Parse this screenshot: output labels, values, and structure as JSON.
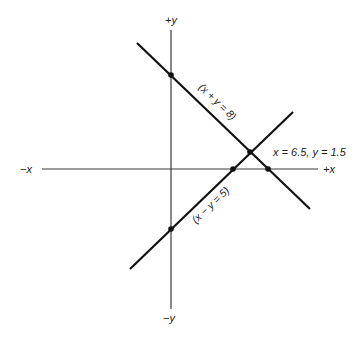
{
  "diagram": {
    "type": "coordinate-plane-linear-equations",
    "axes": {
      "pos_y_label": "+y",
      "neg_y_label": "−y",
      "pos_x_label": "+x",
      "neg_x_label": "−x"
    },
    "lines": [
      {
        "name": "sum-line",
        "equation_label": "(x + y = 8)",
        "slope_direction": "descending"
      },
      {
        "name": "difference-line",
        "equation_label": "(x − y = 5)",
        "slope_direction": "ascending"
      }
    ],
    "solution_label": "x = 6.5, y = 1.5",
    "points": [
      {
        "name": "sum-line-y-intercept",
        "description": "x + y = 8 crosses y-axis"
      },
      {
        "name": "difference-line-y-intercept",
        "description": "x − y = 5 crosses y-axis"
      },
      {
        "name": "difference-line-x-intercept",
        "description": "x − y = 5 crosses x-axis"
      },
      {
        "name": "sum-line-x-intercept",
        "description": "x + y = 8 crosses x-axis"
      },
      {
        "name": "solution-point",
        "description": "intersection of both lines"
      }
    ],
    "colors": {
      "line": "#111111",
      "axis": "#3a3a3a",
      "background": "#ffffff"
    }
  }
}
